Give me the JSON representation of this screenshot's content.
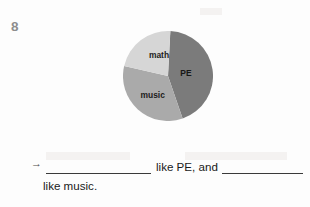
{
  "page": {
    "exercise_number": "8",
    "background_color": "#fdfdfd"
  },
  "chart_data": {
    "type": "pie",
    "title": "",
    "subtitle": "",
    "xlabel": "",
    "ylabel": "",
    "grid": false,
    "legend_position": "inside-slices",
    "labels": [
      "PE",
      "music",
      "math"
    ],
    "values": [
      44,
      34,
      22
    ],
    "unit": "percent",
    "start_angle_deg": 3,
    "direction": "clockwise",
    "slices": [
      {
        "label": "PE",
        "value": 44,
        "color": "#7b7b7b",
        "start_angle_deg": 3,
        "end_angle_deg": 161,
        "label_x_pct": 70,
        "label_y_pct": 47
      },
      {
        "label": "music",
        "value": 34,
        "color": "#aaaaaa",
        "start_angle_deg": 161,
        "end_angle_deg": 283,
        "label_x_pct": 33,
        "label_y_pct": 72
      },
      {
        "label": "math",
        "value": 22,
        "color": "#d6d6d6",
        "start_angle_deg": 283,
        "end_angle_deg": 363,
        "label_x_pct": 40,
        "label_y_pct": 27
      }
    ],
    "annotations": []
  },
  "answer": {
    "arrow_icon": "→",
    "blank_1_value": "",
    "blank_1_placeholder": "",
    "middle_text": "like PE, and",
    "blank_2_value": "",
    "blank_2_placeholder": "",
    "trailing_text": "like music."
  },
  "colors": {
    "slice_pe": "#7b7b7b",
    "slice_music": "#aaaaaa",
    "slice_math": "#d6d6d6",
    "rule_line": "#3a3a3a",
    "number_gray": "#8d8d8d",
    "text": "#1a1a1a"
  }
}
